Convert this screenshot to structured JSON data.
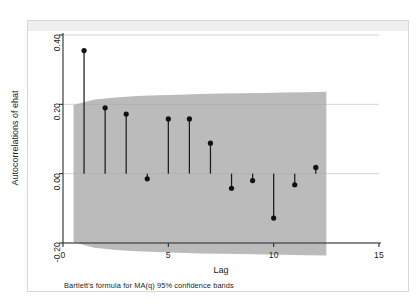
{
  "chart_data": {
    "type": "scatter",
    "title": "",
    "subtitle": "",
    "xlabel": "Lag",
    "ylabel": "Autocorrelations of ehat",
    "note": "Bartlett's formula for MA(q) 95% confidence bands",
    "xlim": [
      0,
      15
    ],
    "ylim": [
      -0.2,
      0.4
    ],
    "xticks": [
      0,
      5,
      10,
      15
    ],
    "xtick_labels": [
      "0",
      "5",
      "10",
      "15"
    ],
    "yticks": [
      -0.2,
      0.0,
      0.2,
      0.4
    ],
    "ytick_labels": [
      "-0.20",
      "0.00",
      "0.20",
      "0.40"
    ],
    "grid": true,
    "legend": "none",
    "x": [
      1,
      2,
      3,
      4,
      5,
      6,
      7,
      8,
      9,
      10,
      11,
      12
    ],
    "values": [
      0.355,
      0.19,
      0.172,
      -0.015,
      0.158,
      0.158,
      0.088,
      -0.042,
      -0.02,
      -0.128,
      -0.032,
      0.018
    ],
    "series": [
      {
        "name": "Autocorrelations of ehat",
        "values": [
          0.355,
          0.19,
          0.172,
          -0.015,
          0.158,
          0.158,
          0.088,
          -0.042,
          -0.02,
          -0.128,
          -0.032,
          0.018
        ]
      }
    ],
    "confidence_band": {
      "label": "Bartlett's formula for MA(q) 95% confidence bands",
      "level": "95%",
      "color": "#a8a8a8",
      "x": [
        0.5,
        1.5,
        2.5,
        3.5,
        4.5,
        5.5,
        6.5,
        7.5,
        8.5,
        9.5,
        10.5,
        11.5,
        12.5
      ],
      "upper": [
        0.198,
        0.214,
        0.22,
        0.224,
        0.226,
        0.228,
        0.23,
        0.231,
        0.232,
        0.233,
        0.234,
        0.235,
        0.236
      ],
      "lower": [
        -0.198,
        -0.214,
        -0.22,
        -0.224,
        -0.226,
        -0.228,
        -0.23,
        -0.231,
        -0.232,
        -0.233,
        -0.234,
        -0.235,
        -0.236
      ]
    },
    "colors": {
      "band": "#a8a8a8",
      "marker": "#111111",
      "stem": "#1c1c1c",
      "axis": "#2b2b2b",
      "grid": "#c9c9c9",
      "background": "#ffffff"
    }
  }
}
